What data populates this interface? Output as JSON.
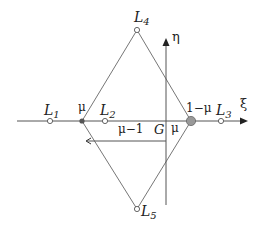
{
  "diagram": {
    "axes": {
      "horizontal_label": "ξ",
      "vertical_label": "η"
    },
    "points": {
      "L1": {
        "label": "L",
        "sub": "1"
      },
      "L2": {
        "label": "L",
        "sub": "2"
      },
      "L3": {
        "label": "L",
        "sub": "3"
      },
      "L4": {
        "label": "L",
        "sub": "4"
      },
      "L5": {
        "label": "L",
        "sub": "5"
      }
    },
    "labels": {
      "mu_left": "μ",
      "one_minus_mu": "1−μ",
      "mu_minus_one": "μ−1",
      "G": "G",
      "mu_right": "μ"
    },
    "colors": {
      "line": "#555555",
      "primary_small": "#555555",
      "primary_large": "#999999"
    }
  }
}
